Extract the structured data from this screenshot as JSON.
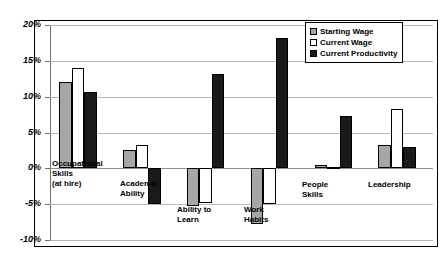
{
  "chart_data": {
    "type": "bar",
    "title": "",
    "xlabel": "",
    "ylabel": "",
    "ylim": [
      -10,
      20
    ],
    "ytick_labels": [
      "20%",
      "15%",
      "10%",
      "5%",
      "0%",
      "-5%",
      "-10%"
    ],
    "ytick_values": [
      20,
      15,
      10,
      5,
      0,
      -5,
      -10
    ],
    "grid": true,
    "legend_position": "top-right",
    "categories": [
      "Occupational\nSkills\n(at hire)",
      "Academic\nAbility",
      "Ability to\nLearn",
      "Work\nHabits",
      "People\nSkills",
      "Leadership"
    ],
    "series": [
      {
        "name": "Starting Wage",
        "color": "#a6a6a6",
        "values": [
          12.0,
          2.5,
          -5.3,
          -7.7,
          0.5,
          3.3
        ]
      },
      {
        "name": "Current Wage",
        "color": "#ffffff",
        "values": [
          14.0,
          3.3,
          -4.8,
          -5.0,
          0.2,
          8.3
        ]
      },
      {
        "name": "Current Productivity",
        "color": "#1a1a1a",
        "values": [
          10.7,
          -5.0,
          13.2,
          18.2,
          7.3,
          3.0
        ]
      }
    ]
  },
  "legend": {
    "items": [
      {
        "label": "Starting Wage"
      },
      {
        "label": "Current Wage"
      },
      {
        "label": "Current Productivity"
      }
    ]
  }
}
